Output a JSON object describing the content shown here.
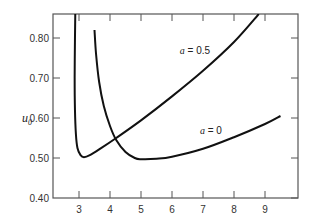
{
  "chart_data": {
    "type": "line",
    "title": "",
    "xlabel": "",
    "ylabel": "u0",
    "ylabel_main": "u",
    "ylabel_sub": "0",
    "xlim": [
      2.25,
      9.9
    ],
    "ylim": [
      0.4,
      0.86
    ],
    "grid": false,
    "x_ticks": [
      3,
      4,
      5,
      6,
      7,
      8,
      9
    ],
    "x_tick_labels": [
      "3",
      "4",
      "5",
      "6",
      "7",
      "8",
      "9"
    ],
    "y_ticks": [
      0.4,
      0.5,
      0.6,
      0.7,
      0.8
    ],
    "y_tick_labels": [
      "0.40",
      "0.50",
      "0.60",
      "0.70",
      "0.80"
    ],
    "series": [
      {
        "name": "a = 0.5",
        "label_var": "a",
        "label_value": "= 0.5",
        "x": [
          2.88,
          2.87,
          2.86,
          2.87,
          2.9,
          2.95,
          3.05,
          3.16,
          3.35,
          3.7,
          4.2,
          5.0,
          6.0,
          7.0,
          8.0,
          8.8
        ],
        "y": [
          0.86,
          0.8,
          0.7,
          0.62,
          0.56,
          0.525,
          0.507,
          0.502,
          0.507,
          0.524,
          0.55,
          0.594,
          0.654,
          0.718,
          0.79,
          0.86
        ]
      },
      {
        "name": "a = 0",
        "label_var": "a",
        "label_value": "= 0",
        "x": [
          3.5,
          3.55,
          3.65,
          3.8,
          4.0,
          4.2,
          4.5,
          4.8,
          5.0,
          5.5,
          6.0,
          7.0,
          8.0,
          9.0,
          9.5
        ],
        "y": [
          0.82,
          0.76,
          0.69,
          0.63,
          0.58,
          0.545,
          0.515,
          0.5,
          0.497,
          0.498,
          0.503,
          0.523,
          0.552,
          0.585,
          0.605
        ]
      }
    ],
    "annotations": [
      {
        "text": "a = 0.5",
        "x": 6.25,
        "y": 0.76
      },
      {
        "text": "a = 0",
        "x": 6.9,
        "y": 0.56
      }
    ]
  }
}
